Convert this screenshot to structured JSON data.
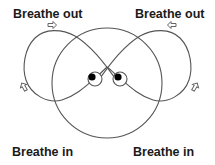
{
  "diagram": {
    "labels": {
      "top_left": "Breathe out",
      "top_right": "Breathe out",
      "bottom_left": "Breathe in",
      "bottom_right": "Breathe in"
    },
    "colors": {
      "line": "#555555",
      "text": "#1a1a1a",
      "dot": "#000000"
    }
  }
}
